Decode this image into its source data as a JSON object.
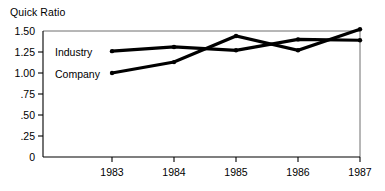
{
  "chart_data": {
    "type": "line",
    "title": "Quick Ratio",
    "xlabel": "",
    "ylabel": "",
    "categories": [
      "1983",
      "1984",
      "1985",
      "1986",
      "1987"
    ],
    "series": [
      {
        "name": "Industry",
        "values": [
          1.26,
          1.31,
          1.27,
          1.4,
          1.39
        ]
      },
      {
        "name": "Company",
        "values": [
          1.0,
          1.13,
          1.44,
          1.27,
          1.52
        ]
      }
    ],
    "ylim": [
      0,
      1.5
    ],
    "ytick_labels": [
      "1.50",
      "1.25",
      "1.00",
      ".75",
      ".50",
      ".25",
      "0"
    ],
    "ytick_values": [
      1.5,
      1.25,
      1.0,
      0.75,
      0.5,
      0.25,
      0
    ],
    "xtick_labels": [
      "1983",
      "1984",
      "1985",
      "1986",
      "1987"
    ],
    "grid": false,
    "legend_position": "inline-left",
    "line_color": "#000000",
    "axis_color": "#000000",
    "background_color": "#ffffff"
  },
  "labels": {
    "title": "Quick Ratio",
    "series_industry": "Industry",
    "series_company": "Company",
    "y0": "1.50",
    "y1": "1.25",
    "y2": "1.00",
    "y3": ".75",
    "y4": ".50",
    "y5": ".25",
    "y6": "0",
    "x0": "1983",
    "x1": "1984",
    "x2": "1985",
    "x3": "1986",
    "x4": "1987"
  }
}
